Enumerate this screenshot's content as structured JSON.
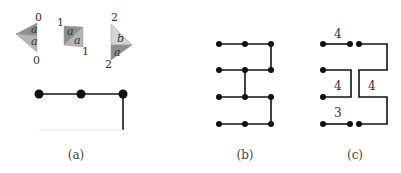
{
  "panels": {
    "a": {
      "caption": "(a)",
      "tiles": [
        {
          "top_label": "0",
          "bottom_label": "0",
          "upper_face": "a",
          "lower_face": "a"
        },
        {
          "top_label": "1",
          "bottom_label": "1",
          "upper_face": "a",
          "lower_face": "a"
        },
        {
          "top_label": "2",
          "bottom_label": "2",
          "upper_face": "b",
          "lower_face": "a"
        }
      ]
    },
    "b": {
      "caption": "(b)"
    },
    "c": {
      "caption": "(c)",
      "labels": [
        "4",
        "4",
        "4",
        "3"
      ]
    }
  },
  "colors": {
    "tile_dark": "#8a8a8a",
    "tile_mid": "#a8a8a8",
    "tile_light": "#cfcfcf",
    "line": "#111111"
  }
}
